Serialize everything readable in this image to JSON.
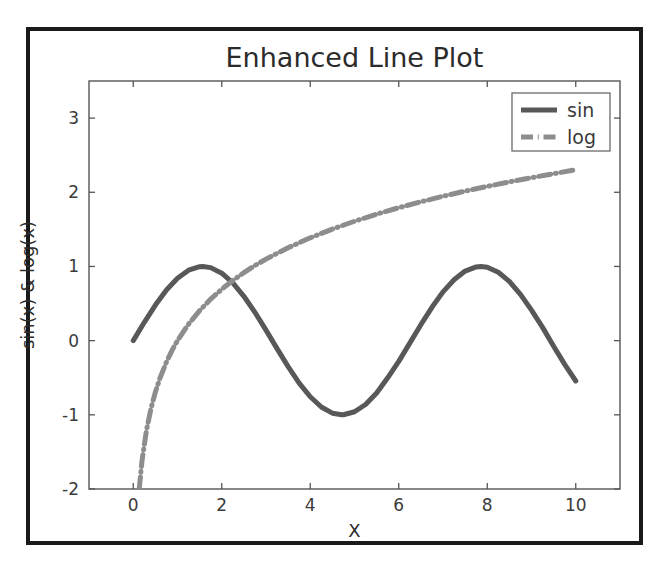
{
  "figure": {
    "background_color": "#ffffff",
    "frame_color": "#1a1a1a",
    "axes_color": "#555555"
  },
  "chart_data": {
    "type": "line",
    "title": "Enhanced Line Plot",
    "xlabel": "X",
    "ylabel": "sin(x) & log(x)",
    "xlim": [
      -1.0,
      11.0
    ],
    "ylim": [
      -2.0,
      3.5
    ],
    "xticks": [
      0,
      2,
      4,
      6,
      8,
      10
    ],
    "xtick_labels": [
      "0",
      "2",
      "4",
      "6",
      "8",
      "10"
    ],
    "yticks": [
      -2,
      -1,
      0,
      1,
      2,
      3
    ],
    "ytick_labels": [
      "-2",
      "-1",
      "0",
      "1",
      "2",
      "3"
    ],
    "grid": false,
    "legend_position": "upper right",
    "legend_entries": [
      "sin",
      "log"
    ],
    "series": [
      {
        "name": "sin",
        "legend_label": "sin",
        "color": "#585858",
        "linestyle": "solid",
        "linewidth": 5,
        "x": [
          0.0,
          0.25,
          0.5,
          0.75,
          1.0,
          1.25,
          1.5,
          1.5708,
          1.75,
          2.0,
          2.25,
          2.5,
          2.75,
          3.0,
          3.1416,
          3.25,
          3.5,
          3.75,
          4.0,
          4.25,
          4.5,
          4.7124,
          4.75,
          5.0,
          5.25,
          5.5,
          5.75,
          6.0,
          6.2832,
          6.5,
          6.75,
          7.0,
          7.25,
          7.5,
          7.75,
          7.854,
          8.0,
          8.25,
          8.5,
          8.75,
          9.0,
          9.25,
          9.5,
          9.75,
          10.0
        ],
        "y": [
          0.0,
          0.247,
          0.479,
          0.682,
          0.841,
          0.949,
          0.997,
          1.0,
          0.984,
          0.909,
          0.778,
          0.598,
          0.382,
          0.141,
          0.0,
          -0.108,
          -0.351,
          -0.572,
          -0.757,
          -0.895,
          -0.978,
          -1.0,
          -0.999,
          -0.959,
          -0.861,
          -0.706,
          -0.501,
          -0.279,
          0.0,
          0.215,
          0.449,
          0.657,
          0.82,
          0.938,
          0.994,
          1.0,
          0.989,
          0.922,
          0.798,
          0.624,
          0.412,
          0.179,
          -0.075,
          -0.32,
          -0.544
        ]
      },
      {
        "name": "log",
        "legend_label": "log",
        "color": "#8d8d8d",
        "linestyle": "dashdot",
        "linewidth": 5,
        "x": [
          0.135,
          0.2,
          0.3,
          0.4,
          0.5,
          0.6,
          0.75,
          0.9,
          1.0,
          1.25,
          1.5,
          1.75,
          2.0,
          2.25,
          2.5,
          2.75,
          3.0,
          3.5,
          4.0,
          4.5,
          5.0,
          5.5,
          6.0,
          6.5,
          7.0,
          7.5,
          8.0,
          8.5,
          9.0,
          9.5,
          10.0
        ],
        "y": [
          -2.0,
          -1.609,
          -1.204,
          -0.916,
          -0.693,
          -0.511,
          -0.288,
          -0.105,
          0.0,
          0.223,
          0.405,
          0.56,
          0.693,
          0.811,
          0.916,
          1.012,
          1.099,
          1.253,
          1.386,
          1.504,
          1.609,
          1.705,
          1.792,
          1.872,
          1.946,
          2.015,
          2.079,
          2.14,
          2.197,
          2.251,
          2.303
        ]
      }
    ]
  }
}
